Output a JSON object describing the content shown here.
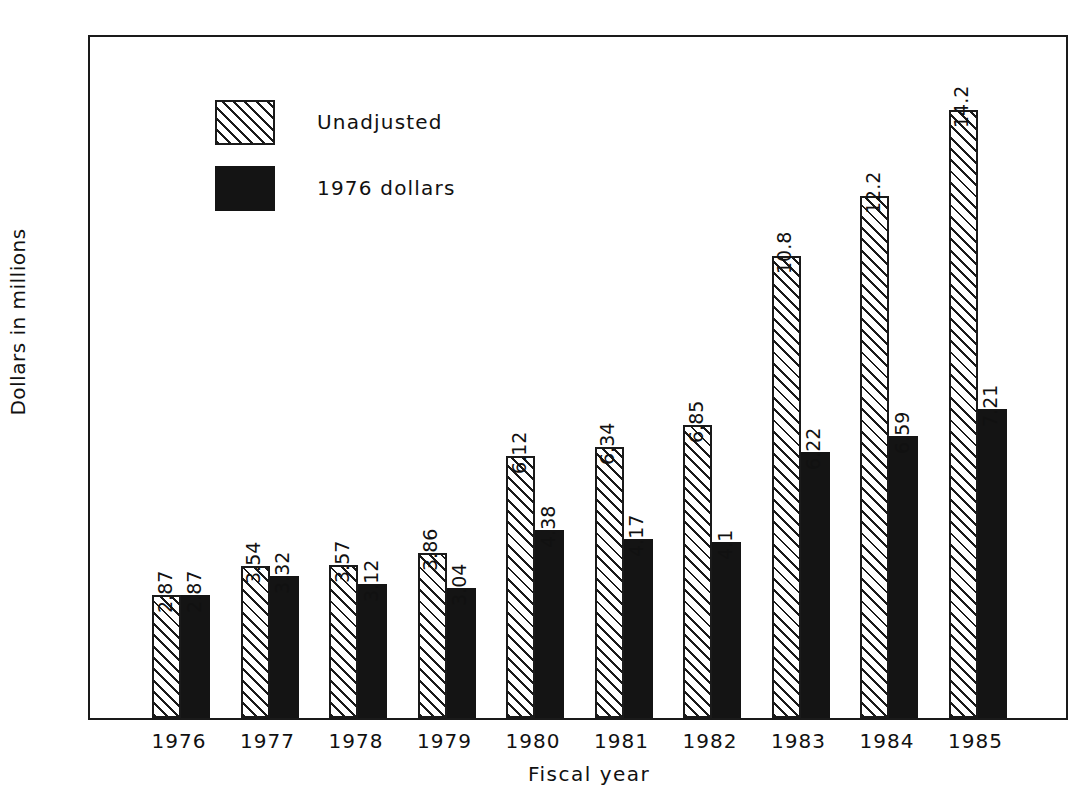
{
  "chart_data": {
    "type": "bar",
    "title": "",
    "xlabel": "Fiscal year",
    "ylabel": "Dollars in millions",
    "categories": [
      "1976",
      "1977",
      "1978",
      "1979",
      "1980",
      "1981",
      "1982",
      "1983",
      "1984",
      "1985"
    ],
    "series": [
      {
        "name": "Unadjusted",
        "style": "hatched",
        "values": [
          2.87,
          3.54,
          3.57,
          3.86,
          6.12,
          6.34,
          6.85,
          10.8,
          12.2,
          14.2
        ],
        "labels": [
          "2.87",
          "3.54",
          "3.57",
          "3.86",
          "6.12",
          "6.34",
          "6.85",
          "10.8",
          "12.2",
          "14.2"
        ]
      },
      {
        "name": "1976 dollars",
        "style": "solid",
        "values": [
          2.87,
          3.32,
          3.12,
          3.04,
          4.38,
          4.17,
          4.1,
          6.22,
          6.59,
          7.21
        ],
        "labels": [
          "2.87",
          "3.32",
          "3.12",
          "3.04",
          "4.38",
          "4.17",
          "4.1",
          "6.22",
          "6.59",
          "7.21"
        ]
      }
    ],
    "ylim": [
      0,
      16
    ],
    "yticks": [
      0,
      2,
      4,
      6,
      8,
      10,
      12,
      14,
      16
    ],
    "ytick_labels": [
      "0",
      "2",
      "4",
      "6",
      "8",
      "10",
      "12",
      "14",
      "16"
    ],
    "grid": false,
    "legend_position": "upper-left",
    "colors": {
      "axis": "#1a1a1a",
      "unadjusted_fill": "#ffffff",
      "unadjusted_hatch": "#1a1a1a",
      "adjusted_fill": "#141414",
      "background": "#ffffff"
    }
  },
  "legend": {
    "entries": [
      {
        "label": "Unadjusted",
        "style": "hatched"
      },
      {
        "label": "1976 dollars",
        "style": "solid"
      }
    ]
  }
}
